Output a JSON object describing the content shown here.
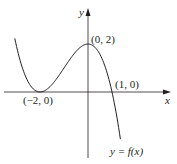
{
  "chart_data": {
    "type": "line",
    "title": "",
    "xlabel": "x",
    "ylabel": "y",
    "curve_label": "y = f(x)",
    "function": "f(x) = -0.5 (x + 2)^2 (x - 1)",
    "x_range": [
      -3.05,
      1.35
    ],
    "ylim": [
      -3,
      3
    ],
    "grid": false,
    "legend": null,
    "x": [
      -3.0,
      -2.5,
      -2.0,
      -1.5,
      -1.0,
      -0.5,
      0.0,
      0.5,
      1.0,
      1.33
    ],
    "values": [
      2.0,
      0.44,
      0.0,
      0.31,
      1.0,
      1.69,
      2.0,
      1.56,
      0.0,
      -1.85
    ],
    "annotations": [
      {
        "point": [
          0,
          2
        ],
        "text": "(0, 2)"
      },
      {
        "point": [
          1,
          0
        ],
        "text": "(1, 0)"
      },
      {
        "point": [
          -2,
          0
        ],
        "text": "(−2, 0)"
      }
    ],
    "color": "#231f20"
  },
  "labels": {
    "x_axis": "x",
    "y_axis": "y",
    "max_point": "(0, 2)",
    "root_point": "(1, 0)",
    "min_point": "(−2, 0)",
    "curve": "y = f(x)"
  }
}
